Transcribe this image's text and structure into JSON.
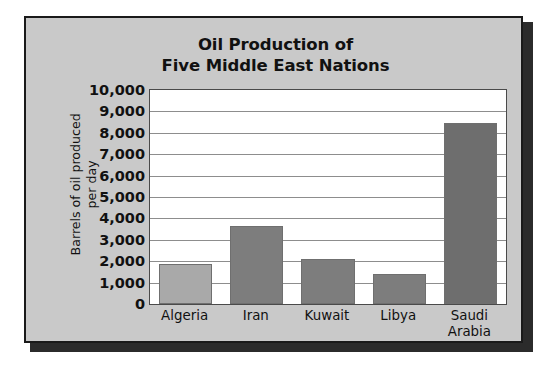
{
  "figure": {
    "background_color": "#c9c9c9",
    "frame_border_color": "#1a1a1a",
    "plot_background_color": "#ffffff",
    "gridline_color": "#8d8d8d",
    "shadow_color": "#2b2b2b"
  },
  "chart_data": {
    "type": "bar",
    "title": "Oil Production of Five Middle East Nations",
    "title_lines": [
      "Oil Production of",
      "Five Middle East Nations"
    ],
    "xlabel": "",
    "ylabel": "Barrels of oil produced per day",
    "ylabel_lines": [
      "Barrels of oil produced",
      "per day"
    ],
    "categories": [
      "Algeria",
      "Iran",
      "Kuwait",
      "Libya",
      "Saudi Arabia"
    ],
    "category_label_lines": [
      [
        "Algeria"
      ],
      [
        "Iran"
      ],
      [
        "Kuwait"
      ],
      [
        "Libya"
      ],
      [
        "Saudi",
        "Arabia"
      ]
    ],
    "values": [
      1850,
      3650,
      2100,
      1400,
      8450
    ],
    "bar_colors": [
      "#a9a9a9",
      "#7d7d7d",
      "#7d7d7d",
      "#7d7d7d",
      "#6e6e6e"
    ],
    "ylim": [
      0,
      10000
    ],
    "ytick_step": 1000,
    "ytick_values": [
      0,
      1000,
      2000,
      3000,
      4000,
      5000,
      6000,
      7000,
      8000,
      9000,
      10000
    ],
    "ytick_labels": [
      "0",
      "1,000",
      "2,000",
      "3,000",
      "4,000",
      "5,000",
      "6,000",
      "7,000",
      "8,000",
      "9,000",
      "10,000"
    ],
    "grid": true,
    "grid_axis": "y",
    "legend": false,
    "legend_position": "none"
  }
}
